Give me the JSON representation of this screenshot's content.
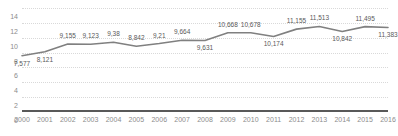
{
  "chart_data": {
    "type": "line",
    "title": "",
    "subtitle": "",
    "xlabel": "",
    "ylabel": "",
    "categories": [
      "2000",
      "2001",
      "2002",
      "2003",
      "2004",
      "2005",
      "2006",
      "2007",
      "2008",
      "2009",
      "2010",
      "2011",
      "2012",
      "2013",
      "2014",
      "2015",
      "2016"
    ],
    "values": [
      7.577,
      8.121,
      9.155,
      9.123,
      9.38,
      8.842,
      9.21,
      9.664,
      9.631,
      10.668,
      10.678,
      10.174,
      11.155,
      11.513,
      10.842,
      11.495,
      11.383
    ],
    "point_labels": [
      "7,577",
      "8,121",
      "9,155",
      "9,123",
      "9,38",
      "8,842",
      "9,21",
      "9,664",
      "9,631",
      "10,668",
      "10,678",
      "10,174",
      "11,155",
      "11,513",
      "10,842",
      "11,495",
      "11,383"
    ],
    "label_positions": [
      "below",
      "below",
      "above",
      "above",
      "above",
      "above",
      "above",
      "above",
      "below",
      "above",
      "above",
      "below",
      "above",
      "above",
      "below",
      "above",
      "below"
    ],
    "ylim": [
      0,
      14
    ],
    "yticks": [
      "0",
      "2",
      "4",
      "6",
      "8",
      "10",
      "12",
      "14"
    ],
    "ytick_values": [
      0,
      2,
      4,
      6,
      8,
      10,
      12,
      14
    ],
    "grid": true,
    "legend": "none",
    "series_color": "#808080",
    "grid_color": "#d9d9d9",
    "axis_color": "#595959",
    "tick_label_color": "#8c8c8c",
    "data_label_color": "#595959"
  }
}
